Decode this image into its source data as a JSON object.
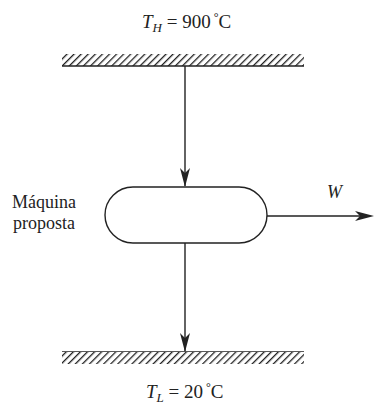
{
  "hot_reservoir": {
    "symbol": "T",
    "subscript": "H",
    "equals": "=",
    "value": "900",
    "degree": "°",
    "unit": "C"
  },
  "cold_reservoir": {
    "symbol": "T",
    "subscript": "L",
    "equals": "=",
    "value": "20",
    "degree": "°",
    "unit": "C"
  },
  "engine": {
    "line1": "Máquina",
    "line2": "proposta"
  },
  "work": {
    "label": "W"
  },
  "colors": {
    "stroke": "#222222",
    "background": "#ffffff"
  }
}
